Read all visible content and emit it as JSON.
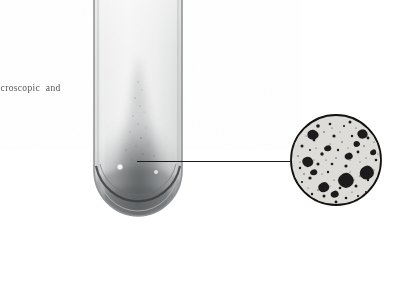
{
  "figure": {
    "kind": "scanned-photographic-plate",
    "background_color": "#ffffff",
    "caption_fragment": "acroscopic  and",
    "caption_color": "#3a3a3a"
  },
  "tube": {
    "label": "test-tube-with-sediment",
    "glass_color": "#e9eaea",
    "glass_edge_color": "#9a9c9c",
    "interior_light": "#efefef",
    "sediment_color": "#6d6f70",
    "sediment_dark": "#4e5051",
    "highlights": [
      {
        "name": "specular-highlight-left",
        "cx": 32,
        "cy": 173,
        "r": 3.2,
        "color": "#fdfdfd"
      },
      {
        "name": "specular-highlight-right",
        "cx": 68,
        "cy": 178,
        "r": 2.4,
        "color": "#f2f2f2"
      }
    ]
  },
  "leader": {
    "label": "leader-line-tube-to-inset",
    "color": "#1a1a1a",
    "from_x": 137,
    "to_x": 292,
    "y": 161
  },
  "inset": {
    "label": "magnified-particle-view",
    "shape": "circle",
    "center_x": 336,
    "center_y": 160,
    "radius": 46,
    "outline_color": "#111111",
    "field_color": "#dcdcda",
    "particle_color": "#1b1b1b",
    "particle_count": 150,
    "description": "speckled micrograph field of dark irregular particle clumps"
  }
}
